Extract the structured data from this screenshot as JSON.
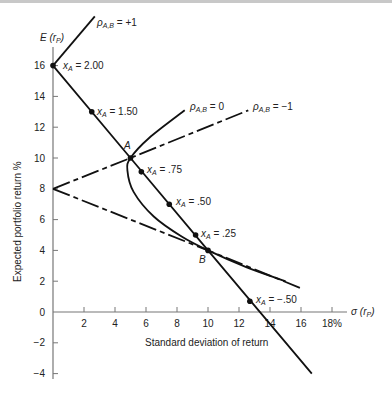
{
  "chart_data": {
    "type": "line",
    "title": "",
    "xlabel": "Standard deviation of return",
    "ylabel": "Expected portfolio return %",
    "x_axis_symbol": "σ (r_P)",
    "y_axis_symbol": "E (r_P)",
    "xlim": [
      0,
      18
    ],
    "ylim": [
      -4,
      16
    ],
    "x_ticks": [
      2,
      4,
      6,
      8,
      10,
      12,
      14,
      16,
      18
    ],
    "x_tick_labels": [
      "2",
      "4",
      "6",
      "8",
      "10",
      "12",
      "14",
      "16",
      "18%"
    ],
    "y_ticks": [
      -4,
      -2,
      0,
      2,
      4,
      6,
      8,
      10,
      12,
      14,
      16
    ],
    "y_tick_labels": [
      "−4",
      "−2",
      "0",
      "2",
      "4",
      "6",
      "8",
      "10",
      "12",
      "14",
      "16"
    ],
    "grid": false,
    "series": [
      {
        "name": "ρA,B = +1",
        "style": "solid",
        "points": [
          [
            0,
            16
          ],
          [
            5,
            10
          ],
          [
            10,
            4
          ],
          [
            16.7,
            -4
          ]
        ],
        "upper_branch": [
          [
            0,
            16
          ],
          [
            2.7,
            19.2
          ]
        ]
      },
      {
        "name": "ρA,B = 0",
        "style": "solid",
        "points": [
          [
            8.5,
            13.1
          ],
          [
            6.2,
            11.3
          ],
          [
            5,
            10
          ],
          [
            4.8,
            9.2
          ],
          [
            5.2,
            7.8
          ],
          [
            6.5,
            6.2
          ],
          [
            8.3,
            4.9
          ],
          [
            10,
            4
          ],
          [
            12.5,
            2.9
          ],
          [
            15,
            2
          ]
        ]
      },
      {
        "name": "ρA,B = −1",
        "style": "dashed",
        "upper": [
          [
            0,
            8
          ],
          [
            5,
            10
          ],
          [
            12.6,
            13.1
          ]
        ],
        "lower": [
          [
            0,
            8
          ],
          [
            10,
            4
          ],
          [
            16.1,
            1.5
          ]
        ]
      }
    ],
    "marked_points": [
      {
        "label": "x_A = 2.00",
        "x": 0,
        "y": 16
      },
      {
        "label": "x_A = 1.50",
        "x": 2.5,
        "y": 13
      },
      {
        "label": "A",
        "x": 5,
        "y": 10
      },
      {
        "label": "x_A = .75",
        "x": 5.7,
        "y": 9.1
      },
      {
        "label": "x_A = .50",
        "x": 7.5,
        "y": 7
      },
      {
        "label": "x_A = .25",
        "x": 9.2,
        "y": 5
      },
      {
        "label": "B",
        "x": 10,
        "y": 4
      },
      {
        "label": "x_A = −.50",
        "x": 12.7,
        "y": 0.7
      }
    ],
    "annotations": [
      {
        "text": "ρA,B = +1",
        "x": 2.8,
        "y": 18.6
      },
      {
        "text": "ρA,B = 0",
        "x": 8.9,
        "y": 13.3
      },
      {
        "text": "ρA,B = −1",
        "x": 13.2,
        "y": 13.3
      }
    ]
  },
  "labels": {
    "y_symbol_main": "E (r",
    "y_symbol_sub": "P",
    "x_symbol_main": "σ (r",
    "x_symbol_sub": "P",
    "xlabel": "Standard deviation of return",
    "ylabel": "Expected portfolio return %",
    "rho_plus1": "ρ",
    "rho_sub": "A,B",
    "rho_plus1_val": " = +1",
    "rho_zero_val": " = 0",
    "rho_minus1_val": " = −1",
    "xa_prefix": "x",
    "xa_sub": "A",
    "xa_200": " = 2.00",
    "xa_150": " = 1.50",
    "xa_075": " = .75",
    "xa_050": " = .50",
    "xa_025": " = .25",
    "xa_m050": " = −.50",
    "point_a": "A",
    "point_b": "B"
  }
}
